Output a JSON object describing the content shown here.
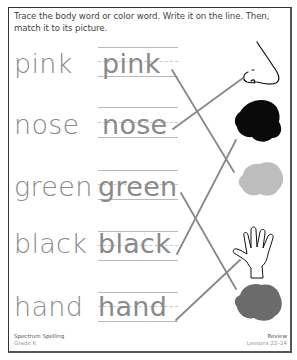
{
  "instructions": "Trace the body word or color word. Write it on the line. Then, match it to its picture.",
  "rows": [
    {
      "word": "pink",
      "trace": "pink"
    },
    {
      "word": "nose",
      "trace": "nose"
    },
    {
      "word": "green",
      "trace": "green"
    },
    {
      "word": "black",
      "trace": "black"
    },
    {
      "word": "hand",
      "trace": "hand"
    }
  ],
  "pictures": [
    {
      "name": "nose",
      "type": "drawing"
    },
    {
      "name": "black",
      "type": "color-blob",
      "color": "#0a0a0a"
    },
    {
      "name": "green",
      "type": "color-blob",
      "color": "#bdbdbd"
    },
    {
      "name": "hand",
      "type": "drawing"
    },
    {
      "name": "pink",
      "type": "color-blob",
      "color": "#6b6b6b"
    }
  ],
  "matches": [
    {
      "from": "pink",
      "to": "light-gray-blob"
    },
    {
      "from": "nose",
      "to": "nose"
    },
    {
      "from": "green",
      "to": "dark-gray-blob"
    },
    {
      "from": "black",
      "to": "black-blob"
    },
    {
      "from": "hand",
      "to": "hand"
    }
  ],
  "footer": {
    "left_title": "Spectrum Spelling",
    "left_sub": "Grade K",
    "right_title": "Review",
    "right_sub": "Lessons 22–24"
  }
}
